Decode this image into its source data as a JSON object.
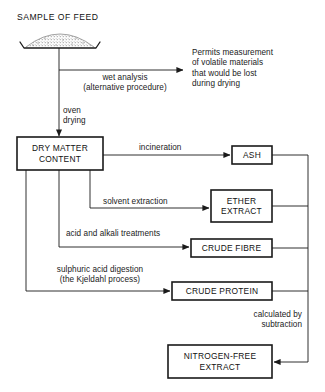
{
  "diagram": {
    "title": "SAMPLE OF FEED",
    "sample_icon": "feed-sample-mound-in-tray",
    "boxes": [
      {
        "id": "dry-matter-content",
        "label": "DRY MATTER\nCONTENT",
        "x": 17,
        "y": 137,
        "w": 86,
        "h": 33
      },
      {
        "id": "ash",
        "label": "ASH",
        "x": 232,
        "y": 146,
        "w": 40,
        "h": 18
      },
      {
        "id": "ether-extract",
        "label": "ETHER\nEXTRACT",
        "x": 211,
        "y": 190,
        "w": 61,
        "h": 32
      },
      {
        "id": "crude-fibre",
        "label": "CRUDE FIBRE",
        "x": 191,
        "y": 239,
        "w": 81,
        "h": 18
      },
      {
        "id": "crude-protein",
        "label": "CRUDE PROTEIN",
        "x": 172,
        "y": 282,
        "w": 100,
        "h": 18
      },
      {
        "id": "nitrogen-free-extract",
        "label": "NITROGEN-FREE\nEXTRACT",
        "x": 168,
        "y": 345,
        "w": 104,
        "h": 33
      }
    ],
    "process_labels": [
      {
        "id": "wet-analysis",
        "text": "wet analysis\n(alternative procedure)",
        "x": 66,
        "y": 73,
        "w": 118,
        "align": "center"
      },
      {
        "id": "oven-drying",
        "text": "oven\ndrying",
        "x": 63,
        "y": 106,
        "w": 60,
        "align": "left"
      },
      {
        "id": "incineration",
        "text": "incineration",
        "x": 139,
        "y": 143,
        "w": 60,
        "align": "left"
      },
      {
        "id": "solvent-extraction",
        "text": "solvent extraction",
        "x": 103,
        "y": 197,
        "w": 90,
        "align": "left"
      },
      {
        "id": "acid-alkali",
        "text": "acid and alkali treatments",
        "x": 66,
        "y": 229,
        "w": 124,
        "align": "left"
      },
      {
        "id": "sulphuric-acid",
        "text": "sulphuric acid digestion\n(the Kjeldahl process)",
        "x": 30,
        "y": 265,
        "w": 140,
        "align": "center"
      },
      {
        "id": "calculated-by-subtraction",
        "text": "calculated by\nsubtraction",
        "x": 202,
        "y": 310,
        "w": 100,
        "align": "right"
      },
      {
        "id": "permits-measurement",
        "text": "Permits measurement\nof volatile materials\nthat would be lost\nduring drying",
        "x": 192,
        "y": 48,
        "w": 130,
        "align": "left"
      }
    ],
    "colors": {
      "line": "#1a1a1a",
      "box_stroke": "#1a1a1a",
      "background": "#ffffff",
      "text": "#1a1a1a",
      "sample_stipple": "#555555"
    }
  }
}
